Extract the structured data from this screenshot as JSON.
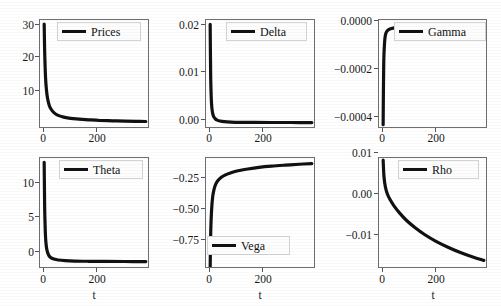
{
  "figure": {
    "background_color": "#ffffff",
    "line_color": "#111111",
    "axis_color": "#6e6e6e",
    "panel_rows": 2,
    "panel_cols": 3
  },
  "chart_data": [
    {
      "type": "line",
      "title": "",
      "legend_label": "Prices",
      "legend_position": "upper right",
      "xlabel": "",
      "ylabel": "",
      "xticks": [
        0,
        200
      ],
      "xtick_labels": [
        "0",
        "200"
      ],
      "yticks": [
        10,
        20,
        30
      ],
      "ytick_labels": [
        "10",
        "20",
        "30"
      ],
      "xlim": [
        -15,
        380
      ],
      "ylim": [
        0.0,
        32.0
      ],
      "grid": false,
      "x": [
        0,
        2,
        5,
        8,
        12,
        18,
        25,
        35,
        50,
        70,
        95,
        125,
        160,
        200,
        245,
        290,
        330,
        365
      ],
      "y": [
        30.8,
        22.0,
        15.0,
        11.6,
        9.0,
        7.0,
        5.8,
        4.8,
        4.0,
        3.5,
        3.1,
        2.9,
        2.7,
        2.5,
        2.4,
        2.3,
        2.25,
        2.2
      ]
    },
    {
      "type": "line",
      "title": "",
      "legend_label": "Delta",
      "legend_position": "upper right",
      "xlabel": "",
      "ylabel": "",
      "xticks": [
        0,
        200
      ],
      "xtick_labels": [
        "0",
        "200"
      ],
      "yticks": [
        0.0,
        0.01,
        0.02
      ],
      "ytick_labels": [
        "0.00",
        "0.01",
        "0.02"
      ],
      "xlim": [
        -15,
        380
      ],
      "ylim": [
        -0.0012,
        0.0232
      ],
      "grid": false,
      "x": [
        0,
        1,
        2,
        4,
        6,
        9,
        13,
        18,
        25,
        35,
        50,
        75,
        110,
        160,
        220,
        290,
        365
      ],
      "y": [
        0.0222,
        0.015,
        0.0098,
        0.0055,
        0.0036,
        0.0023,
        0.0015,
        0.0011,
        0.0008,
        0.0006,
        0.00045,
        0.00035,
        0.0003,
        0.00028,
        0.00026,
        0.00025,
        0.00024
      ]
    },
    {
      "type": "line",
      "title": "",
      "legend_label": "Gamma",
      "legend_position": "upper right",
      "xlabel": "",
      "ylabel": "",
      "xticks": [
        0,
        200
      ],
      "xtick_labels": [
        "0",
        "200"
      ],
      "yticks": [
        -0.0004,
        -0.0002,
        0.0
      ],
      "ytick_labels": [
        "−0.0004",
        "−0.0002",
        "0.0000"
      ],
      "xlim": [
        -15,
        380
      ],
      "ylim": [
        -0.00048,
        3e-05
      ],
      "grid": false,
      "x": [
        0,
        1,
        2,
        3,
        5,
        7,
        10,
        14,
        20,
        30,
        45,
        70,
        110,
        170,
        250,
        320,
        365
      ],
      "y": [
        -0.00046,
        -0.0003,
        -0.00019,
        -0.00013,
        -8e-05,
        -5e-05,
        -3.2e-05,
        -2.2e-05,
        -1.5e-05,
        -1e-05,
        -7e-06,
        -5e-06,
        -4e-06,
        -3.2e-06,
        -2.8e-06,
        -2.5e-06,
        -2.2e-06
      ]
    },
    {
      "type": "line",
      "title": "",
      "legend_label": "Theta",
      "legend_position": "upper right",
      "xlabel": "t",
      "ylabel": "",
      "xticks": [
        0,
        200
      ],
      "xtick_labels": [
        "0",
        "200"
      ],
      "yticks": [
        0,
        5,
        10
      ],
      "ytick_labels": [
        "0",
        "5",
        "10"
      ],
      "xlim": [
        -15,
        380
      ],
      "ylim": [
        -0.8,
        14.6
      ],
      "grid": false,
      "x": [
        0,
        1,
        2,
        4,
        6,
        9,
        13,
        18,
        25,
        35,
        50,
        75,
        110,
        160,
        220,
        290,
        365
      ],
      "y": [
        14.0,
        10.2,
        7.2,
        4.4,
        3.0,
        2.0,
        1.4,
        1.0,
        0.75,
        0.58,
        0.45,
        0.36,
        0.3,
        0.27,
        0.25,
        0.24,
        0.23
      ]
    },
    {
      "type": "line",
      "title": "",
      "legend_label": "Vega",
      "legend_position": "lower left",
      "xlabel": "t",
      "ylabel": "",
      "xticks": [
        0,
        200
      ],
      "xtick_labels": [
        "0",
        "200"
      ],
      "yticks": [
        -0.75,
        -0.5,
        -0.25
      ],
      "ytick_labels": [
        "−0.75",
        "−0.50",
        "−0.25"
      ],
      "xlim": [
        -15,
        380
      ],
      "ylim": [
        -0.92,
        -0.03
      ],
      "grid": false,
      "x": [
        0,
        2,
        5,
        9,
        14,
        20,
        28,
        40,
        55,
        75,
        100,
        135,
        175,
        220,
        270,
        320,
        365
      ],
      "y": [
        -0.9,
        -0.62,
        -0.45,
        -0.34,
        -0.28,
        -0.24,
        -0.21,
        -0.185,
        -0.165,
        -0.148,
        -0.132,
        -0.118,
        -0.105,
        -0.095,
        -0.087,
        -0.08,
        -0.075
      ]
    },
    {
      "type": "line",
      "title": "",
      "legend_label": "Rho",
      "legend_position": "upper right",
      "xlabel": "t",
      "ylabel": "",
      "xticks": [
        0,
        200
      ],
      "xtick_labels": [
        "0",
        "200"
      ],
      "yticks": [
        -0.01,
        0.0,
        0.01
      ],
      "ytick_labels": [
        "−0.01",
        "0.00",
        "0.01"
      ],
      "xlim": [
        -15,
        380
      ],
      "ylim": [
        -0.0165,
        0.0105
      ],
      "grid": false,
      "x": [
        0,
        3,
        8,
        15,
        25,
        40,
        60,
        85,
        115,
        150,
        190,
        235,
        280,
        325,
        365
      ],
      "y": [
        0.01,
        0.006,
        0.0035,
        0.0018,
        0.0004,
        -0.0012,
        -0.0029,
        -0.0047,
        -0.0064,
        -0.0081,
        -0.0097,
        -0.0112,
        -0.0125,
        -0.0136,
        -0.0144
      ]
    }
  ]
}
